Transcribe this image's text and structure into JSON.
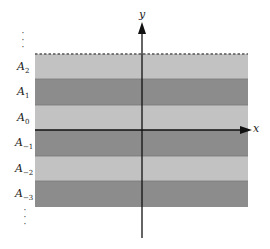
{
  "diagram": {
    "axes": {
      "x_label": "x",
      "y_label": "y"
    },
    "layers": [
      {
        "label_base": "A",
        "label_sub": "2",
        "shade": "light"
      },
      {
        "label_base": "A",
        "label_sub": "1",
        "shade": "dark"
      },
      {
        "label_base": "A",
        "label_sub": "0",
        "shade": "light"
      },
      {
        "label_base": "A",
        "label_sub": "−1",
        "shade": "dark"
      },
      {
        "label_base": "A",
        "label_sub": "−2",
        "shade": "light"
      },
      {
        "label_base": "A",
        "label_sub": "−3",
        "shade": "dark"
      }
    ],
    "ellipsis_top": "⋮",
    "ellipsis_bottom": "⋮",
    "colors": {
      "light_band": "#c2c2c2",
      "dark_band": "#8c8c8c",
      "axis": "#111111",
      "dashed_boundary": "#555555"
    }
  }
}
